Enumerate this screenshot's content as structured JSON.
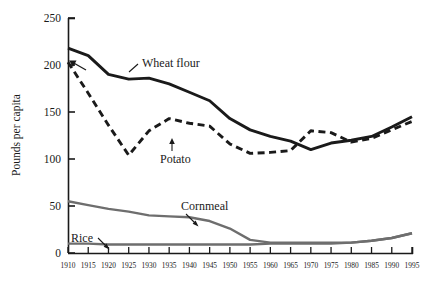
{
  "chart_data": {
    "type": "line",
    "title": "",
    "xlabel": "",
    "ylabel": "Pounds per capita",
    "xlim": [
      1910,
      1995
    ],
    "ylim": [
      0,
      250
    ],
    "yticks": [
      0,
      50,
      100,
      150,
      200,
      250
    ],
    "xticks": [
      1910,
      1915,
      1920,
      1925,
      1930,
      1935,
      1940,
      1945,
      1950,
      1955,
      1960,
      1965,
      1970,
      1975,
      1980,
      1985,
      1990,
      1995
    ],
    "grid": false,
    "legend_position": "inline-annotations",
    "x": [
      1910,
      1915,
      1920,
      1925,
      1930,
      1935,
      1940,
      1945,
      1950,
      1955,
      1960,
      1965,
      1970,
      1975,
      1980,
      1985,
      1990,
      1995
    ],
    "series": [
      {
        "name": "Wheat flour",
        "style": "solid",
        "color": "#1a1a1a",
        "values": [
          218,
          210,
          190,
          185,
          186,
          180,
          171,
          162,
          143,
          131,
          124,
          119,
          110,
          117,
          120,
          124,
          134,
          145
        ]
      },
      {
        "name": "Potato",
        "style": "dashed",
        "color": "#1a1a1a",
        "values": [
          203,
          170,
          136,
          104,
          130,
          143,
          138,
          135,
          116,
          106,
          107,
          109,
          130,
          128,
          118,
          122,
          131,
          140
        ]
      },
      {
        "name": "Cornmeal",
        "style": "solid",
        "color": "#6e6e6e",
        "values": [
          55,
          51,
          47,
          44,
          40,
          39,
          38,
          34,
          26,
          14,
          11,
          11,
          11,
          11,
          11,
          13,
          16,
          21
        ]
      },
      {
        "name": "Rice",
        "style": "solid",
        "color": "#6e6e6e",
        "values": [
          10,
          10,
          9,
          9,
          9,
          9,
          9,
          9,
          9,
          9,
          10,
          10,
          10,
          10,
          11,
          13,
          16,
          21
        ]
      }
    ],
    "annotations": [
      {
        "label": "Wheat flour",
        "series": "Wheat flour"
      },
      {
        "label": "Potato",
        "series": "Potato"
      },
      {
        "label": "Cornmeal",
        "series": "Cornmeal"
      },
      {
        "label": "Rice",
        "series": "Rice"
      }
    ]
  }
}
